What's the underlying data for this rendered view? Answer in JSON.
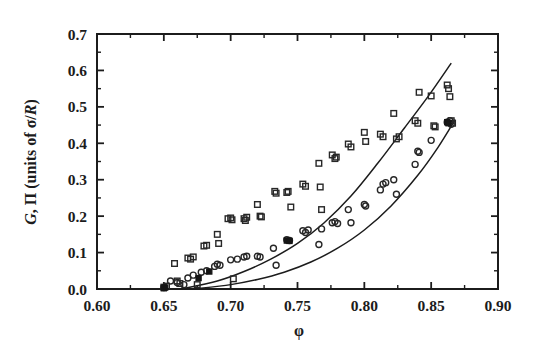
{
  "chart_data": {
    "type": "scatter",
    "title": "",
    "xlabel": "φ",
    "ylabel": "G, Π (units of σ/R)",
    "ylabel_parts": {
      "sym1": "G",
      "comma": ", ",
      "sym2": "Π",
      "units_open": " (units of ",
      "sigma": "σ/",
      "r": "R",
      "units_close": ")"
    },
    "xlim": [
      0.6,
      0.9
    ],
    "ylim": [
      0.0,
      0.7
    ],
    "xticks": [
      0.6,
      0.65,
      0.7,
      0.75,
      0.8,
      0.85,
      0.9
    ],
    "xtick_labels": [
      "0.60",
      "0.65",
      "0.70",
      "0.75",
      "0.80",
      "0.85",
      "0.90"
    ],
    "yticks": [
      0.0,
      0.1,
      0.2,
      0.3,
      0.4,
      0.5,
      0.6,
      0.7
    ],
    "ytick_labels": [
      "0.0",
      "0.1",
      "0.2",
      "0.3",
      "0.4",
      "0.5",
      "0.6",
      "0.7"
    ],
    "x_minor_step": 0.025,
    "y_minor_step": 0.05,
    "grid": false,
    "legend": "none",
    "tick_direction": "in",
    "frame": "box",
    "series": [
      {
        "name": "Π (osmotic pressure)",
        "marker": "open-square",
        "values": [
          [
            0.65,
            0.005
          ],
          [
            0.652,
            0.008
          ],
          [
            0.658,
            0.07
          ],
          [
            0.66,
            0.022
          ],
          [
            0.662,
            0.015
          ],
          [
            0.668,
            0.085
          ],
          [
            0.67,
            0.082
          ],
          [
            0.672,
            0.088
          ],
          [
            0.675,
            0.012
          ],
          [
            0.68,
            0.118
          ],
          [
            0.682,
            0.12
          ],
          [
            0.69,
            0.15
          ],
          [
            0.691,
            0.125
          ],
          [
            0.698,
            0.193
          ],
          [
            0.7,
            0.195
          ],
          [
            0.701,
            0.19
          ],
          [
            0.702,
            0.028
          ],
          [
            0.71,
            0.193
          ],
          [
            0.711,
            0.188
          ],
          [
            0.712,
            0.197
          ],
          [
            0.72,
            0.232
          ],
          [
            0.722,
            0.2
          ],
          [
            0.723,
            0.198
          ],
          [
            0.733,
            0.268
          ],
          [
            0.734,
            0.263
          ],
          [
            0.742,
            0.265
          ],
          [
            0.743,
            0.268
          ],
          [
            0.745,
            0.225
          ],
          [
            0.754,
            0.288
          ],
          [
            0.756,
            0.282
          ],
          [
            0.766,
            0.345
          ],
          [
            0.767,
            0.28
          ],
          [
            0.768,
            0.218
          ],
          [
            0.776,
            0.368
          ],
          [
            0.778,
            0.358
          ],
          [
            0.779,
            0.362
          ],
          [
            0.788,
            0.398
          ],
          [
            0.79,
            0.39
          ],
          [
            0.8,
            0.43
          ],
          [
            0.801,
            0.405
          ],
          [
            0.812,
            0.425
          ],
          [
            0.814,
            0.418
          ],
          [
            0.822,
            0.482
          ],
          [
            0.824,
            0.412
          ],
          [
            0.826,
            0.418
          ],
          [
            0.838,
            0.462
          ],
          [
            0.84,
            0.455
          ],
          [
            0.841,
            0.54
          ],
          [
            0.85,
            0.53
          ],
          [
            0.852,
            0.448
          ],
          [
            0.853,
            0.445
          ],
          [
            0.862,
            0.56
          ],
          [
            0.863,
            0.55
          ],
          [
            0.864,
            0.528
          ],
          [
            0.865,
            0.462
          ],
          [
            0.866,
            0.455
          ]
        ]
      },
      {
        "name": "G (shear modulus)",
        "marker": "open-circle",
        "values": [
          [
            0.65,
            0.004
          ],
          [
            0.655,
            0.022
          ],
          [
            0.66,
            0.018
          ],
          [
            0.665,
            0.012
          ],
          [
            0.668,
            0.03
          ],
          [
            0.672,
            0.038
          ],
          [
            0.678,
            0.046
          ],
          [
            0.682,
            0.05
          ],
          [
            0.688,
            0.062
          ],
          [
            0.69,
            0.068
          ],
          [
            0.692,
            0.065
          ],
          [
            0.7,
            0.08
          ],
          [
            0.705,
            0.082
          ],
          [
            0.71,
            0.088
          ],
          [
            0.712,
            0.09
          ],
          [
            0.72,
            0.09
          ],
          [
            0.722,
            0.088
          ],
          [
            0.732,
            0.112
          ],
          [
            0.734,
            0.065
          ],
          [
            0.742,
            0.135
          ],
          [
            0.744,
            0.133
          ],
          [
            0.754,
            0.16
          ],
          [
            0.756,
            0.155
          ],
          [
            0.758,
            0.162
          ],
          [
            0.766,
            0.122
          ],
          [
            0.768,
            0.165
          ],
          [
            0.776,
            0.182
          ],
          [
            0.778,
            0.185
          ],
          [
            0.78,
            0.18
          ],
          [
            0.788,
            0.218
          ],
          [
            0.79,
            0.182
          ],
          [
            0.8,
            0.232
          ],
          [
            0.801,
            0.228
          ],
          [
            0.812,
            0.272
          ],
          [
            0.814,
            0.288
          ],
          [
            0.816,
            0.292
          ],
          [
            0.822,
            0.3
          ],
          [
            0.824,
            0.26
          ],
          [
            0.838,
            0.342
          ],
          [
            0.84,
            0.378
          ],
          [
            0.841,
            0.375
          ],
          [
            0.85,
            0.408
          ],
          [
            0.862,
            0.458
          ],
          [
            0.864,
            0.462
          ],
          [
            0.865,
            0.452
          ]
        ]
      },
      {
        "name": "filled markers (overlap)",
        "marker": "filled",
        "values": [
          [
            0.65,
            0.002
          ],
          [
            0.651,
            0.004
          ],
          [
            0.676,
            0.03
          ],
          [
            0.684,
            0.048
          ],
          [
            0.742,
            0.133
          ],
          [
            0.744,
            0.132
          ],
          [
            0.862,
            0.458
          ],
          [
            0.863,
            0.455
          ]
        ]
      }
    ],
    "fit_curves": [
      {
        "name": "upper-fit",
        "description": "smooth fit through Π lower envelope rising to 0.60",
        "points": [
          [
            0.663,
            0.0
          ],
          [
            0.69,
            0.022
          ],
          [
            0.71,
            0.048
          ],
          [
            0.73,
            0.082
          ],
          [
            0.75,
            0.125
          ],
          [
            0.77,
            0.182
          ],
          [
            0.79,
            0.255
          ],
          [
            0.81,
            0.345
          ],
          [
            0.83,
            0.442
          ],
          [
            0.848,
            0.53
          ],
          [
            0.865,
            0.62
          ]
        ]
      },
      {
        "name": "lower-fit",
        "description": "smooth fit through G data rising to 0.46",
        "points": [
          [
            0.672,
            0.0
          ],
          [
            0.7,
            0.012
          ],
          [
            0.72,
            0.026
          ],
          [
            0.74,
            0.046
          ],
          [
            0.76,
            0.074
          ],
          [
            0.78,
            0.112
          ],
          [
            0.8,
            0.162
          ],
          [
            0.82,
            0.228
          ],
          [
            0.84,
            0.312
          ],
          [
            0.855,
            0.388
          ],
          [
            0.868,
            0.465
          ]
        ]
      }
    ]
  }
}
